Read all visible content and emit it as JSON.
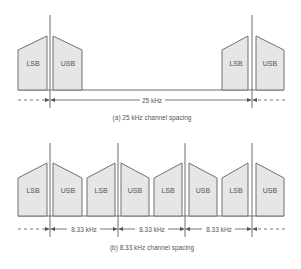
{
  "diagram_a": {
    "caption": "(a) 25 kHz channel spacing",
    "spacing_label": "25 kHz",
    "channels": [
      {
        "lsb": "LSB",
        "usb": "USB"
      },
      {
        "lsb": "LSB",
        "usb": "USB"
      }
    ]
  },
  "diagram_b": {
    "caption": "(b) 8.33 kHz channel spacing",
    "spacing_labels": [
      "8.33 kHz",
      "8.33 kHz",
      "8.33 kHz"
    ],
    "channels": [
      {
        "lsb": "LSB",
        "usb": "USB"
      },
      {
        "lsb": "LSB",
        "usb": "USB"
      },
      {
        "lsb": "LSB",
        "usb": "USB"
      },
      {
        "lsb": "LSB",
        "usb": "USB"
      }
    ]
  },
  "colors": {
    "block_fill": "#e6e6e6",
    "line": "#6e6e6e",
    "text": "#555555"
  }
}
